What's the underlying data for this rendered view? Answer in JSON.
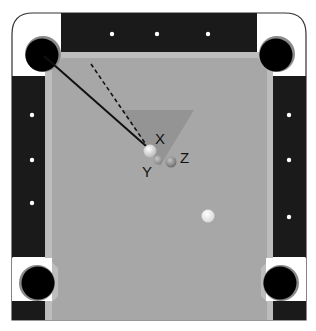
{
  "diagram": {
    "colors": {
      "frame_outline": "#333333",
      "corner_white": "#ffffff",
      "rail": "#1a1a1a",
      "cushion": "#bdbdbd",
      "felt": "#a7a7a7",
      "pocket": "#000000",
      "pocket_rim": "#8a8a8a",
      "diamond": "#ffffff",
      "zone_triangle": "#8e8e8e",
      "line": "#111111"
    },
    "diamonds": {
      "top": [
        [
          112,
          34
        ],
        [
          157,
          34
        ],
        [
          208,
          34
        ]
      ],
      "left": [
        [
          32,
          115
        ],
        [
          32,
          160
        ],
        [
          32,
          203
        ]
      ],
      "right": [
        [
          289,
          115
        ],
        [
          289,
          160
        ],
        [
          289,
          217
        ]
      ]
    },
    "pockets": [
      {
        "name": "top-left-pocket",
        "cx": 42,
        "cy": 53,
        "r": 17
      },
      {
        "name": "top-right-pocket",
        "cx": 278,
        "cy": 53,
        "r": 17
      },
      {
        "name": "bottom-left-pocket",
        "cx": 38,
        "cy": 282,
        "r": 17
      },
      {
        "name": "bottom-right-pocket",
        "cx": 280,
        "cy": 282,
        "r": 17
      }
    ],
    "zone_triangle": {
      "points": "122,110 194,110 160,166"
    },
    "aim_line_solid": {
      "x1": 44,
      "y1": 56,
      "x2": 146,
      "y2": 146
    },
    "aim_line_dashed": {
      "x1": 91,
      "y1": 64,
      "x2": 145,
      "y2": 143
    },
    "balls": [
      {
        "id": "X",
        "cx": 150,
        "cy": 151,
        "r": 6.5,
        "fill": "#e0e0e0",
        "label": "X",
        "lx": 155,
        "ly": 144
      },
      {
        "id": "Y",
        "cx": 158,
        "cy": 160,
        "r": 4.5,
        "fill": "#9a9a9a",
        "label": "Y",
        "lx": 142,
        "ly": 177
      },
      {
        "id": "Z",
        "cx": 171,
        "cy": 162,
        "r": 5.5,
        "fill": "#8a8a8a",
        "label": "Z",
        "lx": 181,
        "ly": 162
      },
      {
        "id": "cue",
        "cx": 208,
        "cy": 216,
        "r": 6.5,
        "fill": "#f4f4f4",
        "label": "",
        "lx": 0,
        "ly": 0
      }
    ],
    "labels": {
      "x": "X",
      "y": "Y",
      "z": "Z"
    }
  }
}
